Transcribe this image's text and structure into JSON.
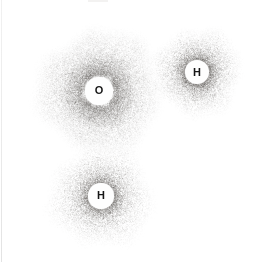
{
  "figure": {
    "background_color": "#ffffff",
    "canvas": {
      "width": 264,
      "height": 262
    },
    "dot_base_color": "#4a4642",
    "atoms": [
      {
        "element": "oxygen",
        "label": "O",
        "cx": 99,
        "cy": 91,
        "nucleus_radius": 13.6,
        "cloud": {
          "profile": "diffuse",
          "r_max": 64,
          "halo_r": 32,
          "dots": 42000,
          "alpha": 0.21,
          "seed": 11
        }
      },
      {
        "element": "hydrogen",
        "label": "H",
        "cx": 197,
        "cy": 72,
        "nucleus_radius": 12,
        "cloud": {
          "profile": "ring",
          "r_max": 45,
          "dots": 16500,
          "alpha": 0.3,
          "seed": 23
        }
      },
      {
        "element": "hydrogen",
        "label": "H",
        "cx": 101,
        "cy": 196,
        "nucleus_radius": 12.6,
        "cloud": {
          "profile": "ring",
          "r_max": 53,
          "dots": 19000,
          "alpha": 0.29,
          "seed": 37
        }
      }
    ],
    "artifacts": {
      "left_edge_line_color": "#ececec",
      "top_smudge_color": "#f3f2f1"
    }
  }
}
